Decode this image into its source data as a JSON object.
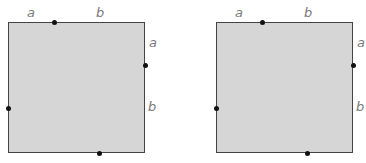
{
  "figures": [
    {
      "name": "square-left",
      "labels": {
        "top_a": "a",
        "top_b": "b",
        "right_a": "a",
        "right_b": "b"
      }
    },
    {
      "name": "square-right",
      "labels": {
        "top_a": "a",
        "top_b": "b",
        "right_a": "a",
        "right_b": "b"
      }
    }
  ],
  "colors": {
    "fill": "#d6d6d6",
    "border": "#444444",
    "label": "#7a7a7a",
    "dot": "#111111"
  }
}
